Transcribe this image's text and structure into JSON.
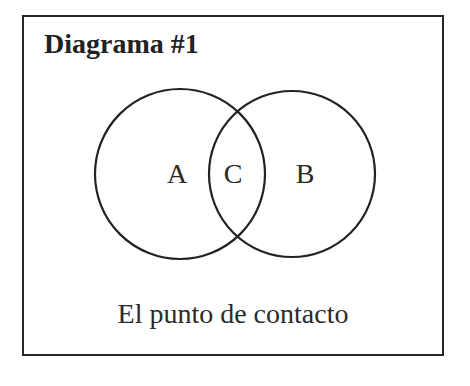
{
  "diagram": {
    "title": "Diagrama #1",
    "caption": "El punto de contacto",
    "type": "venn",
    "sets": [
      {
        "id": "A",
        "label": "A",
        "cx": 156,
        "cy": 157,
        "r": 85
      },
      {
        "id": "B",
        "label": "B",
        "cx": 268,
        "cy": 157,
        "r": 83
      }
    ],
    "intersection": {
      "id": "C",
      "label": "C"
    },
    "labels": {
      "a": "A",
      "b": "B",
      "c": "C"
    },
    "colors": {
      "stroke": "#222222",
      "text": "#2a2a2a",
      "background": "#ffffff"
    }
  }
}
